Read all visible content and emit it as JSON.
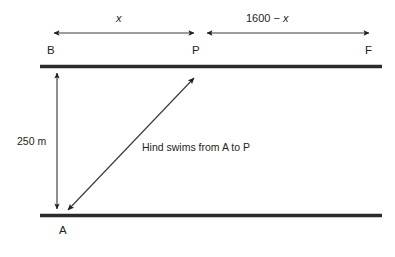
{
  "diagram": {
    "colors": {
      "line": "#2b2b2b",
      "arrow": "#231f20",
      "text": "#231f20",
      "background": "#ffffff"
    },
    "points": {
      "b": "B",
      "p": "P",
      "f": "F",
      "a": "A"
    },
    "measures": {
      "segment_bp": "x",
      "segment_pf_prefix": "1600 ",
      "segment_pf_minus": "− ",
      "segment_pf_var": "x",
      "segment_pf_full": "1600 − x",
      "vertical_distance": "250 m"
    },
    "annotations": {
      "swim_path": "Hind swims from A to P"
    },
    "geometry": {
      "top_bank_y": 66,
      "bottom_bank_y": 215,
      "bank_left_x": 40,
      "bank_right_x": 382,
      "point_b_x": 57,
      "point_p_x": 196,
      "point_f_x": 370,
      "top_arrow_y": 33,
      "vertical_arrow_x": 57,
      "diagonal_from": "A",
      "diagonal_to": "P"
    }
  }
}
